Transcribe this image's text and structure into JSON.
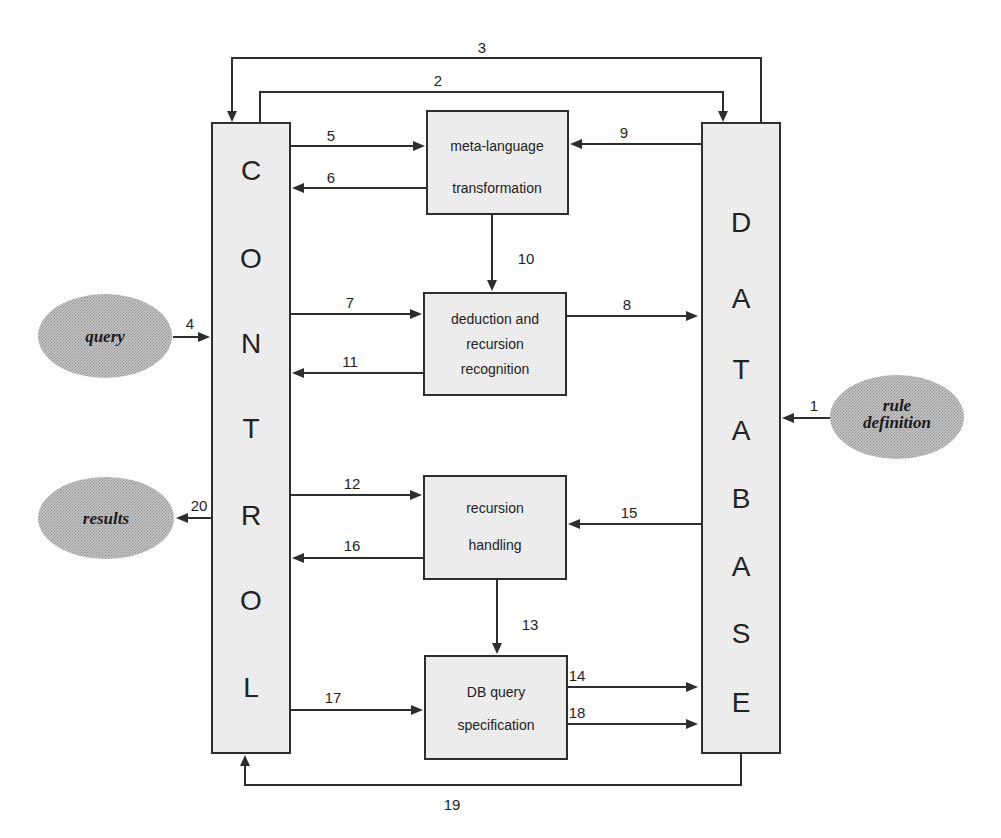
{
  "diagram": {
    "type": "system-architecture-flow",
    "colors": {
      "line": "#2e2e2e",
      "box_fill": "#ececec",
      "ellipse_fill": "#b4b4b4",
      "text": "#1e1e1e"
    },
    "columns": {
      "control": {
        "letters": [
          "C",
          "O",
          "N",
          "T",
          "R",
          "O",
          "L"
        ]
      },
      "database": {
        "letters": [
          "D",
          "A",
          "T",
          "A",
          "B",
          "A",
          "S",
          "E"
        ]
      }
    },
    "modules": {
      "meta": {
        "lines": [
          "meta-language",
          "transformation"
        ]
      },
      "deduction": {
        "lines": [
          "deduction and",
          "recursion",
          "recognition"
        ]
      },
      "recursion": {
        "lines": [
          "recursion",
          "handling"
        ]
      },
      "dbquery": {
        "lines": [
          "DB query",
          "specification"
        ]
      }
    },
    "externals": {
      "query": {
        "lines": [
          "query"
        ]
      },
      "results": {
        "lines": [
          "results"
        ]
      },
      "rule": {
        "lines": [
          "rule",
          "definition"
        ]
      }
    },
    "edges": [
      {
        "id": "1",
        "from": "rule definition",
        "to": "DATABASE"
      },
      {
        "id": "2",
        "from": "CONTROL",
        "to": "DATABASE"
      },
      {
        "id": "3",
        "from": "DATABASE",
        "to": "CONTROL"
      },
      {
        "id": "4",
        "from": "query",
        "to": "CONTROL"
      },
      {
        "id": "5",
        "from": "CONTROL",
        "to": "meta-language transformation"
      },
      {
        "id": "6",
        "from": "meta-language transformation",
        "to": "CONTROL"
      },
      {
        "id": "7",
        "from": "CONTROL",
        "to": "deduction and recursion recognition"
      },
      {
        "id": "8",
        "from": "deduction and recursion recognition",
        "to": "DATABASE"
      },
      {
        "id": "9",
        "from": "DATABASE",
        "to": "meta-language transformation"
      },
      {
        "id": "10",
        "from": "meta-language transformation",
        "to": "deduction and recursion recognition"
      },
      {
        "id": "11",
        "from": "deduction and recursion recognition",
        "to": "CONTROL"
      },
      {
        "id": "12",
        "from": "CONTROL",
        "to": "recursion handling"
      },
      {
        "id": "13",
        "from": "recursion handling",
        "to": "DB query specification"
      },
      {
        "id": "14",
        "from": "DB query specification",
        "to": "DATABASE"
      },
      {
        "id": "15",
        "from": "DATABASE",
        "to": "recursion handling"
      },
      {
        "id": "16",
        "from": "recursion handling",
        "to": "CONTROL"
      },
      {
        "id": "17",
        "from": "CONTROL",
        "to": "DB query specification"
      },
      {
        "id": "18",
        "from": "DB query specification",
        "to": "DATABASE"
      },
      {
        "id": "19",
        "from": "DATABASE",
        "to": "CONTROL"
      },
      {
        "id": "20",
        "from": "CONTROL",
        "to": "results"
      }
    ],
    "edge_labels": {
      "e1": "1",
      "e2": "2",
      "e3": "3",
      "e4": "4",
      "e5": "5",
      "e6": "6",
      "e7": "7",
      "e8": "8",
      "e9": "9",
      "e10": "10",
      "e11": "11",
      "e12": "12",
      "e13": "13",
      "e14": "14",
      "e15": "15",
      "e16": "16",
      "e17": "17",
      "e18": "18",
      "e19": "19",
      "e20": "20"
    }
  }
}
